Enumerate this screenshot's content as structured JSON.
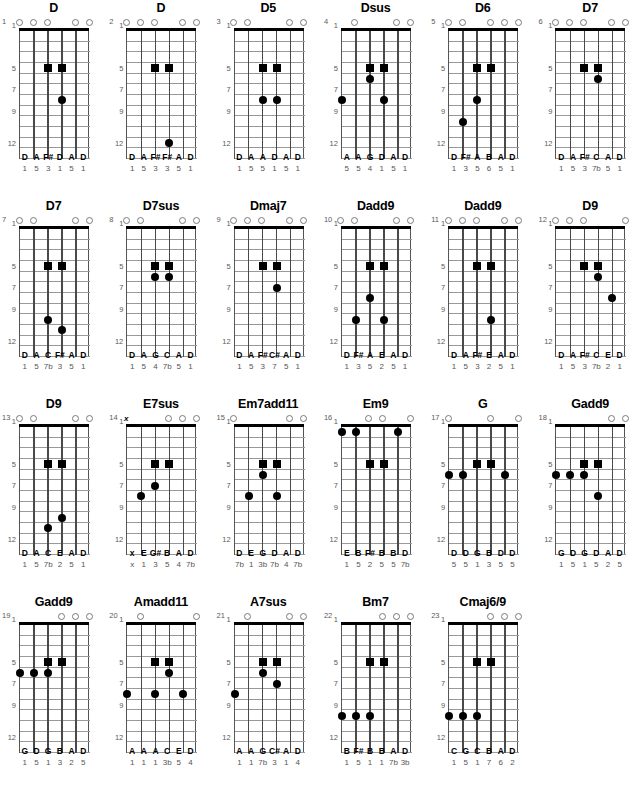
{
  "page": {
    "fret_labels": [
      "1",
      "5",
      "7",
      "9",
      "12"
    ],
    "fret_label_positions": [
      1,
      5,
      7,
      9,
      12
    ],
    "open_symbol": "open-circle",
    "muted_symbol": "x",
    "num_strings": 6,
    "num_frets": 12,
    "columns": 6,
    "rows": 4
  },
  "diagrams": [
    {
      "index": "1",
      "name": "D",
      "marks": [
        "o",
        "o",
        "o",
        "",
        "o",
        "o"
      ],
      "dots": [
        {
          "string": 3,
          "fret": 4,
          "shape": "square"
        },
        {
          "string": 4,
          "fret": 4,
          "shape": "square"
        },
        {
          "string": 4,
          "fret": 7,
          "shape": "circle"
        }
      ],
      "notes": [
        "D",
        "A",
        "F#",
        "D",
        "A",
        "D"
      ],
      "degrees": [
        "1",
        "5",
        "3",
        "1",
        "5",
        "1"
      ]
    },
    {
      "index": "2",
      "name": "D",
      "marks": [
        "o",
        "o",
        "o",
        "",
        "o",
        "o"
      ],
      "dots": [
        {
          "string": 3,
          "fret": 4,
          "shape": "square"
        },
        {
          "string": 4,
          "fret": 4,
          "shape": "square"
        },
        {
          "string": 4,
          "fret": 11,
          "shape": "circle"
        }
      ],
      "notes": [
        "D",
        "A",
        "F#",
        "F#",
        "A",
        "D"
      ],
      "degrees": [
        "1",
        "5",
        "3",
        "3",
        "5",
        "1"
      ]
    },
    {
      "index": "3",
      "name": "D5",
      "marks": [
        "o",
        "o",
        "",
        "",
        "o",
        "o"
      ],
      "dots": [
        {
          "string": 3,
          "fret": 4,
          "shape": "square"
        },
        {
          "string": 4,
          "fret": 4,
          "shape": "square"
        },
        {
          "string": 3,
          "fret": 7,
          "shape": "circle"
        },
        {
          "string": 4,
          "fret": 7,
          "shape": "circle"
        }
      ],
      "notes": [
        "D",
        "A",
        "A",
        "D",
        "A",
        "D"
      ],
      "degrees": [
        "1",
        "5",
        "5",
        "1",
        "5",
        "1"
      ]
    },
    {
      "index": "4",
      "name": "Dsus",
      "marks": [
        "",
        "o",
        "",
        "",
        "o",
        "o"
      ],
      "dots": [
        {
          "string": 3,
          "fret": 4,
          "shape": "square"
        },
        {
          "string": 4,
          "fret": 4,
          "shape": "square"
        },
        {
          "string": 3,
          "fret": 5,
          "shape": "circle"
        },
        {
          "string": 1,
          "fret": 7,
          "shape": "circle"
        },
        {
          "string": 4,
          "fret": 7,
          "shape": "circle"
        }
      ],
      "notes": [
        "A",
        "A",
        "G",
        "D",
        "A",
        "D"
      ],
      "degrees": [
        "5",
        "5",
        "4",
        "1",
        "5",
        "1"
      ]
    },
    {
      "index": "5",
      "name": "D6",
      "marks": [
        "o",
        "o",
        "",
        "o",
        "o",
        "o"
      ],
      "dots": [
        {
          "string": 3,
          "fret": 4,
          "shape": "square"
        },
        {
          "string": 4,
          "fret": 4,
          "shape": "square"
        },
        {
          "string": 3,
          "fret": 7,
          "shape": "circle"
        },
        {
          "string": 2,
          "fret": 9,
          "shape": "circle"
        }
      ],
      "notes": [
        "D",
        "F#",
        "A",
        "B",
        "A",
        "D"
      ],
      "degrees": [
        "1",
        "3",
        "5",
        "6",
        "5",
        "1"
      ]
    },
    {
      "index": "6",
      "name": "D7",
      "marks": [
        "o",
        "o",
        "o",
        "",
        "o",
        "o"
      ],
      "dots": [
        {
          "string": 3,
          "fret": 4,
          "shape": "square"
        },
        {
          "string": 4,
          "fret": 4,
          "shape": "square"
        },
        {
          "string": 4,
          "fret": 5,
          "shape": "circle"
        }
      ],
      "notes": [
        "D",
        "A",
        "F#",
        "C",
        "A",
        "D"
      ],
      "degrees": [
        "1",
        "5",
        "3",
        "7b",
        "5",
        "1"
      ]
    },
    {
      "index": "7",
      "name": "D7",
      "marks": [
        "o",
        "o",
        "",
        "",
        "o",
        "o"
      ],
      "dots": [
        {
          "string": 3,
          "fret": 4,
          "shape": "square"
        },
        {
          "string": 4,
          "fret": 4,
          "shape": "square"
        },
        {
          "string": 3,
          "fret": 9,
          "shape": "circle"
        },
        {
          "string": 4,
          "fret": 10,
          "shape": "circle"
        }
      ],
      "notes": [
        "D",
        "A",
        "C",
        "F#",
        "A",
        "D"
      ],
      "degrees": [
        "1",
        "5",
        "7b",
        "3",
        "5",
        "1"
      ]
    },
    {
      "index": "8",
      "name": "D7sus",
      "marks": [
        "o",
        "o",
        "",
        "",
        "o",
        "o"
      ],
      "dots": [
        {
          "string": 3,
          "fret": 4,
          "shape": "square"
        },
        {
          "string": 4,
          "fret": 4,
          "shape": "square"
        },
        {
          "string": 3,
          "fret": 5,
          "shape": "circle"
        },
        {
          "string": 4,
          "fret": 5,
          "shape": "circle"
        }
      ],
      "notes": [
        "D",
        "A",
        "G",
        "C",
        "A",
        "D"
      ],
      "degrees": [
        "1",
        "5",
        "4",
        "7b",
        "5",
        "1"
      ]
    },
    {
      "index": "9",
      "name": "Dmaj7",
      "marks": [
        "o",
        "o",
        "o",
        "",
        "o",
        "o"
      ],
      "dots": [
        {
          "string": 3,
          "fret": 4,
          "shape": "square"
        },
        {
          "string": 4,
          "fret": 4,
          "shape": "square"
        },
        {
          "string": 4,
          "fret": 6,
          "shape": "circle"
        }
      ],
      "notes": [
        "D",
        "A",
        "F#",
        "C#",
        "A",
        "D"
      ],
      "degrees": [
        "1",
        "5",
        "3",
        "7",
        "5",
        "1"
      ]
    },
    {
      "index": "10",
      "name": "Dadd9",
      "marks": [
        "o",
        "o",
        "",
        "",
        "o",
        "o"
      ],
      "dots": [
        {
          "string": 3,
          "fret": 4,
          "shape": "square"
        },
        {
          "string": 4,
          "fret": 4,
          "shape": "square"
        },
        {
          "string": 3,
          "fret": 7,
          "shape": "circle"
        },
        {
          "string": 2,
          "fret": 9,
          "shape": "circle"
        },
        {
          "string": 4,
          "fret": 9,
          "shape": "circle"
        }
      ],
      "notes": [
        "D",
        "F#",
        "A",
        "E",
        "A",
        "D"
      ],
      "degrees": [
        "1",
        "3",
        "5",
        "2",
        "5",
        "1"
      ]
    },
    {
      "index": "11",
      "name": "Dadd9",
      "marks": [
        "o",
        "o",
        "o",
        "",
        "o",
        "o"
      ],
      "dots": [
        {
          "string": 3,
          "fret": 4,
          "shape": "square"
        },
        {
          "string": 4,
          "fret": 4,
          "shape": "square"
        },
        {
          "string": 4,
          "fret": 9,
          "shape": "circle"
        }
      ],
      "notes": [
        "D",
        "A",
        "F#",
        "E",
        "A",
        "D"
      ],
      "degrees": [
        "1",
        "5",
        "3",
        "2",
        "5",
        "1"
      ]
    },
    {
      "index": "12",
      "name": "D9",
      "marks": [
        "o",
        "o",
        "o",
        "",
        "",
        "o"
      ],
      "dots": [
        {
          "string": 3,
          "fret": 4,
          "shape": "square"
        },
        {
          "string": 4,
          "fret": 4,
          "shape": "square"
        },
        {
          "string": 4,
          "fret": 5,
          "shape": "circle"
        },
        {
          "string": 5,
          "fret": 7,
          "shape": "circle"
        }
      ],
      "notes": [
        "D",
        "A",
        "F#",
        "C",
        "E",
        "D"
      ],
      "degrees": [
        "1",
        "5",
        "3",
        "7b",
        "2",
        "1"
      ]
    },
    {
      "index": "13",
      "name": "D9",
      "marks": [
        "o",
        "o",
        "",
        "",
        "o",
        "o"
      ],
      "dots": [
        {
          "string": 3,
          "fret": 4,
          "shape": "square"
        },
        {
          "string": 4,
          "fret": 4,
          "shape": "square"
        },
        {
          "string": 4,
          "fret": 9,
          "shape": "circle"
        },
        {
          "string": 3,
          "fret": 10,
          "shape": "circle"
        }
      ],
      "notes": [
        "D",
        "A",
        "C",
        "E",
        "A",
        "D"
      ],
      "degrees": [
        "1",
        "5",
        "7b",
        "2",
        "5",
        "1"
      ]
    },
    {
      "index": "14",
      "name": "E7sus",
      "marks": [
        "x",
        "",
        "",
        "o",
        "o",
        "o"
      ],
      "dots": [
        {
          "string": 3,
          "fret": 4,
          "shape": "square"
        },
        {
          "string": 4,
          "fret": 4,
          "shape": "square"
        },
        {
          "string": 3,
          "fret": 6,
          "shape": "circle"
        },
        {
          "string": 2,
          "fret": 7,
          "shape": "circle"
        }
      ],
      "notes": [
        "x",
        "E",
        "G#",
        "B",
        "A",
        "D"
      ],
      "degrees": [
        "x",
        "1",
        "3",
        "5",
        "4",
        "7b"
      ]
    },
    {
      "index": "15",
      "name": "Em7add11",
      "marks": [
        "o",
        "",
        "",
        "",
        "o",
        "o"
      ],
      "dots": [
        {
          "string": 3,
          "fret": 4,
          "shape": "square"
        },
        {
          "string": 4,
          "fret": 4,
          "shape": "square"
        },
        {
          "string": 3,
          "fret": 5,
          "shape": "circle"
        },
        {
          "string": 2,
          "fret": 7,
          "shape": "circle"
        },
        {
          "string": 4,
          "fret": 7,
          "shape": "circle"
        }
      ],
      "notes": [
        "D",
        "E",
        "G",
        "D",
        "A",
        "D"
      ],
      "degrees": [
        "7b",
        "1",
        "3b",
        "7b",
        "4",
        "7b"
      ]
    },
    {
      "index": "16",
      "name": "Em9",
      "marks": [
        "",
        "",
        "o",
        "o",
        "",
        "o"
      ],
      "dots": [
        {
          "string": 1,
          "fret": 1,
          "shape": "circle"
        },
        {
          "string": 2,
          "fret": 1,
          "shape": "circle"
        },
        {
          "string": 5,
          "fret": 1,
          "shape": "circle"
        },
        {
          "string": 3,
          "fret": 4,
          "shape": "square"
        },
        {
          "string": 4,
          "fret": 4,
          "shape": "square"
        }
      ],
      "notes": [
        "E",
        "B",
        "F#",
        "B",
        "B",
        "D"
      ],
      "degrees": [
        "1",
        "5",
        "2",
        "5",
        "5",
        "7b"
      ]
    },
    {
      "index": "17",
      "name": "G",
      "marks": [
        "o",
        "",
        "",
        "o",
        "",
        "o"
      ],
      "dots": [
        {
          "string": 3,
          "fret": 4,
          "shape": "square"
        },
        {
          "string": 4,
          "fret": 4,
          "shape": "square"
        },
        {
          "string": 1,
          "fret": 5,
          "shape": "circle"
        },
        {
          "string": 2,
          "fret": 5,
          "shape": "circle"
        },
        {
          "string": 5,
          "fret": 5,
          "shape": "circle"
        }
      ],
      "notes": [
        "D",
        "D",
        "G",
        "B",
        "D",
        "D"
      ],
      "degrees": [
        "5",
        "5",
        "1",
        "3",
        "5",
        "5"
      ]
    },
    {
      "index": "18",
      "name": "Gadd9",
      "marks": [
        "",
        "",
        "",
        "",
        "o",
        "o"
      ],
      "dots": [
        {
          "string": 3,
          "fret": 4,
          "shape": "square"
        },
        {
          "string": 4,
          "fret": 4,
          "shape": "square"
        },
        {
          "string": 1,
          "fret": 5,
          "shape": "circle"
        },
        {
          "string": 2,
          "fret": 5,
          "shape": "circle"
        },
        {
          "string": 3,
          "fret": 5,
          "shape": "circle"
        },
        {
          "string": 4,
          "fret": 7,
          "shape": "circle"
        }
      ],
      "notes": [
        "G",
        "D",
        "G",
        "D",
        "A",
        "D"
      ],
      "degrees": [
        "1",
        "5",
        "1",
        "5",
        "2",
        "5"
      ]
    },
    {
      "index": "19",
      "name": "Gadd9",
      "marks": [
        "",
        "",
        "",
        "o",
        "o",
        "o"
      ],
      "dots": [
        {
          "string": 3,
          "fret": 4,
          "shape": "square"
        },
        {
          "string": 4,
          "fret": 4,
          "shape": "square"
        },
        {
          "string": 1,
          "fret": 5,
          "shape": "circle"
        },
        {
          "string": 2,
          "fret": 5,
          "shape": "circle"
        },
        {
          "string": 3,
          "fret": 5,
          "shape": "circle"
        }
      ],
      "notes": [
        "G",
        "D",
        "G",
        "B",
        "A",
        "D"
      ],
      "degrees": [
        "1",
        "5",
        "1",
        "3",
        "2",
        "5"
      ]
    },
    {
      "index": "20",
      "name": "Amadd11",
      "marks": [
        "",
        "o",
        "",
        "",
        "",
        "o"
      ],
      "dots": [
        {
          "string": 3,
          "fret": 4,
          "shape": "square"
        },
        {
          "string": 4,
          "fret": 4,
          "shape": "square"
        },
        {
          "string": 4,
          "fret": 5,
          "shape": "circle"
        },
        {
          "string": 1,
          "fret": 7,
          "shape": "circle"
        },
        {
          "string": 3,
          "fret": 7,
          "shape": "circle"
        },
        {
          "string": 5,
          "fret": 7,
          "shape": "circle"
        }
      ],
      "notes": [
        "A",
        "A",
        "A",
        "C",
        "E",
        "D"
      ],
      "degrees": [
        "1",
        "1",
        "1",
        "3b",
        "5",
        "4"
      ]
    },
    {
      "index": "21",
      "name": "A7sus",
      "marks": [
        "",
        "o",
        "",
        "",
        "o",
        "o"
      ],
      "dots": [
        {
          "string": 3,
          "fret": 4,
          "shape": "square"
        },
        {
          "string": 4,
          "fret": 4,
          "shape": "square"
        },
        {
          "string": 3,
          "fret": 5,
          "shape": "circle"
        },
        {
          "string": 4,
          "fret": 6,
          "shape": "circle"
        },
        {
          "string": 1,
          "fret": 7,
          "shape": "circle"
        }
      ],
      "notes": [
        "A",
        "A",
        "G",
        "C#",
        "A",
        "D"
      ],
      "degrees": [
        "1",
        "1",
        "7b",
        "3",
        "1",
        "4"
      ]
    },
    {
      "index": "22",
      "name": "Bm7",
      "marks": [
        "",
        "",
        "",
        "o",
        "o",
        "o"
      ],
      "dots": [
        {
          "string": 3,
          "fret": 4,
          "shape": "square"
        },
        {
          "string": 4,
          "fret": 4,
          "shape": "square"
        },
        {
          "string": 1,
          "fret": 9,
          "shape": "circle"
        },
        {
          "string": 2,
          "fret": 9,
          "shape": "circle"
        },
        {
          "string": 3,
          "fret": 9,
          "shape": "circle"
        }
      ],
      "notes": [
        "B",
        "F#",
        "B",
        "B",
        "A",
        "D"
      ],
      "degrees": [
        "1",
        "5",
        "1",
        "1",
        "7b",
        "3b"
      ]
    },
    {
      "index": "23",
      "name": "Cmaj6/9",
      "marks": [
        "",
        "",
        "",
        "o",
        "o",
        "o"
      ],
      "dots": [
        {
          "string": 3,
          "fret": 4,
          "shape": "square"
        },
        {
          "string": 4,
          "fret": 4,
          "shape": "square"
        },
        {
          "string": 1,
          "fret": 9,
          "shape": "circle"
        },
        {
          "string": 2,
          "fret": 9,
          "shape": "circle"
        },
        {
          "string": 3,
          "fret": 9,
          "shape": "circle"
        }
      ],
      "notes": [
        "C",
        "G",
        "C",
        "B",
        "A",
        "D"
      ],
      "degrees": [
        "1",
        "5",
        "1",
        "7",
        "6",
        "2"
      ]
    }
  ]
}
